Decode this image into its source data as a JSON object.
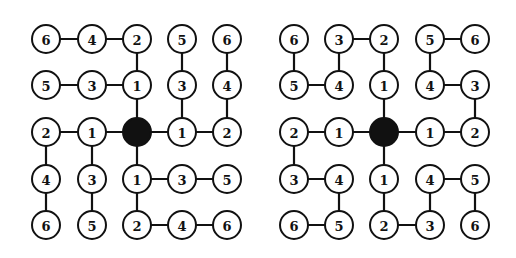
{
  "colors": {
    "line": "#111111",
    "node_fill": "#ffffff",
    "root_fill": "#111111"
  },
  "layout": {
    "radius": 14,
    "rows_y": [
      39,
      85,
      132,
      179,
      225
    ]
  },
  "graphs": [
    {
      "name": "left-tree",
      "cols_x": [
        46,
        92,
        137,
        182,
        227
      ],
      "labels": [
        [
          "6",
          "4",
          "2",
          "5",
          "6"
        ],
        [
          "5",
          "3",
          "1",
          "3",
          "4"
        ],
        [
          "2",
          "1",
          "",
          "1",
          "2"
        ],
        [
          "4",
          "3",
          "1",
          "3",
          "5"
        ],
        [
          "6",
          "5",
          "2",
          "4",
          "6"
        ]
      ],
      "root": [
        2,
        2
      ],
      "edges": [
        [
          [
            0,
            0
          ],
          [
            0,
            1
          ]
        ],
        [
          [
            0,
            1
          ],
          [
            0,
            2
          ]
        ],
        [
          [
            0,
            2
          ],
          [
            1,
            2
          ]
        ],
        [
          [
            0,
            3
          ],
          [
            1,
            3
          ]
        ],
        [
          [
            0,
            4
          ],
          [
            1,
            4
          ]
        ],
        [
          [
            1,
            0
          ],
          [
            1,
            1
          ]
        ],
        [
          [
            1,
            1
          ],
          [
            1,
            2
          ]
        ],
        [
          [
            1,
            2
          ],
          [
            2,
            2
          ]
        ],
        [
          [
            1,
            3
          ],
          [
            2,
            3
          ]
        ],
        [
          [
            1,
            4
          ],
          [
            2,
            4
          ]
        ],
        [
          [
            2,
            0
          ],
          [
            2,
            1
          ]
        ],
        [
          [
            2,
            1
          ],
          [
            2,
            2
          ]
        ],
        [
          [
            2,
            2
          ],
          [
            2,
            3
          ]
        ],
        [
          [
            2,
            3
          ],
          [
            2,
            4
          ]
        ],
        [
          [
            2,
            0
          ],
          [
            3,
            0
          ]
        ],
        [
          [
            2,
            1
          ],
          [
            3,
            1
          ]
        ],
        [
          [
            2,
            2
          ],
          [
            3,
            2
          ]
        ],
        [
          [
            3,
            2
          ],
          [
            3,
            3
          ]
        ],
        [
          [
            3,
            3
          ],
          [
            3,
            4
          ]
        ],
        [
          [
            3,
            0
          ],
          [
            4,
            0
          ]
        ],
        [
          [
            3,
            1
          ],
          [
            4,
            1
          ]
        ],
        [
          [
            3,
            2
          ],
          [
            4,
            2
          ]
        ],
        [
          [
            4,
            2
          ],
          [
            4,
            3
          ]
        ],
        [
          [
            4,
            3
          ],
          [
            4,
            4
          ]
        ]
      ]
    },
    {
      "name": "right-tree",
      "cols_x": [
        294,
        339,
        384,
        430,
        475
      ],
      "labels": [
        [
          "6",
          "3",
          "2",
          "5",
          "6"
        ],
        [
          "5",
          "4",
          "1",
          "4",
          "3"
        ],
        [
          "2",
          "1",
          "",
          "1",
          "2"
        ],
        [
          "3",
          "4",
          "1",
          "4",
          "5"
        ],
        [
          "6",
          "5",
          "2",
          "3",
          "6"
        ]
      ],
      "root": [
        2,
        2
      ],
      "edges": [
        [
          [
            0,
            1
          ],
          [
            0,
            2
          ]
        ],
        [
          [
            0,
            3
          ],
          [
            0,
            4
          ]
        ],
        [
          [
            0,
            0
          ],
          [
            1,
            0
          ]
        ],
        [
          [
            0,
            1
          ],
          [
            1,
            1
          ]
        ],
        [
          [
            0,
            2
          ],
          [
            1,
            2
          ]
        ],
        [
          [
            0,
            3
          ],
          [
            1,
            3
          ]
        ],
        [
          [
            1,
            0
          ],
          [
            1,
            1
          ]
        ],
        [
          [
            1,
            3
          ],
          [
            1,
            4
          ]
        ],
        [
          [
            1,
            2
          ],
          [
            2,
            2
          ]
        ],
        [
          [
            1,
            4
          ],
          [
            2,
            4
          ]
        ],
        [
          [
            2,
            0
          ],
          [
            2,
            1
          ]
        ],
        [
          [
            2,
            1
          ],
          [
            2,
            2
          ]
        ],
        [
          [
            2,
            2
          ],
          [
            2,
            3
          ]
        ],
        [
          [
            2,
            3
          ],
          [
            2,
            4
          ]
        ],
        [
          [
            2,
            0
          ],
          [
            3,
            0
          ]
        ],
        [
          [
            2,
            2
          ],
          [
            3,
            2
          ]
        ],
        [
          [
            3,
            0
          ],
          [
            3,
            1
          ]
        ],
        [
          [
            3,
            3
          ],
          [
            3,
            4
          ]
        ],
        [
          [
            3,
            1
          ],
          [
            4,
            1
          ]
        ],
        [
          [
            3,
            2
          ],
          [
            4,
            2
          ]
        ],
        [
          [
            3,
            3
          ],
          [
            4,
            3
          ]
        ],
        [
          [
            3,
            4
          ],
          [
            4,
            4
          ]
        ],
        [
          [
            4,
            0
          ],
          [
            4,
            1
          ]
        ],
        [
          [
            4,
            2
          ],
          [
            4,
            3
          ]
        ]
      ]
    }
  ]
}
